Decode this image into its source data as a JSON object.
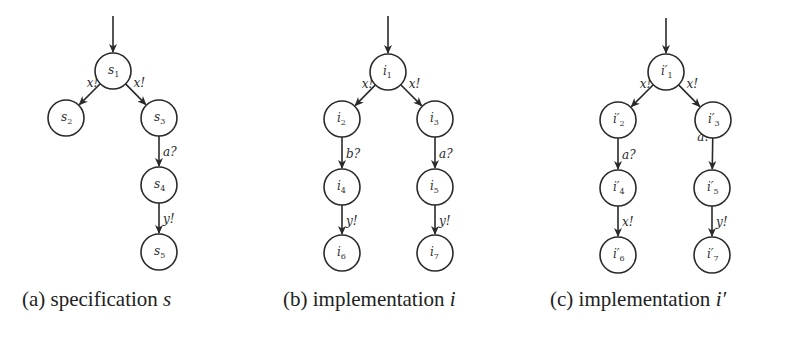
{
  "figure": {
    "panels": [
      {
        "id": "a",
        "caption_prefix": "(a) specification ",
        "caption_var": "s",
        "caption_x": 22,
        "init_arrow": {
          "x": 113,
          "y1": 16,
          "y2": 52
        },
        "nodes": [
          {
            "id": "s1",
            "base": "s",
            "prime": "",
            "sub": "1",
            "x": 113,
            "y": 71
          },
          {
            "id": "s2",
            "base": "s",
            "prime": "",
            "sub": "2",
            "x": 66,
            "y": 118
          },
          {
            "id": "s3",
            "base": "s",
            "prime": "",
            "sub": "3",
            "x": 159,
            "y": 118
          },
          {
            "id": "s4",
            "base": "s",
            "prime": "",
            "sub": "4",
            "x": 159,
            "y": 185
          },
          {
            "id": "s5",
            "base": "s",
            "prime": "",
            "sub": "5",
            "x": 159,
            "y": 252
          }
        ],
        "edges": [
          {
            "from": "s1",
            "to": "s2",
            "label": "x!"
          },
          {
            "from": "s1",
            "to": "s3",
            "label": "x!"
          },
          {
            "from": "s3",
            "to": "s4",
            "label": "a?"
          },
          {
            "from": "s4",
            "to": "s5",
            "label": "y!"
          }
        ]
      },
      {
        "id": "b",
        "caption_prefix": "(b) implementation ",
        "caption_var": "i",
        "caption_x": 283,
        "init_arrow": {
          "x": 388,
          "y1": 16,
          "y2": 53
        },
        "nodes": [
          {
            "id": "i1",
            "base": "i",
            "prime": "",
            "sub": "1",
            "x": 388,
            "y": 72
          },
          {
            "id": "i2",
            "base": "i",
            "prime": "",
            "sub": "2",
            "x": 342,
            "y": 119
          },
          {
            "id": "i3",
            "base": "i",
            "prime": "",
            "sub": "3",
            "x": 435,
            "y": 119
          },
          {
            "id": "i4",
            "base": "i",
            "prime": "",
            "sub": "4",
            "x": 342,
            "y": 187
          },
          {
            "id": "i5",
            "base": "i",
            "prime": "",
            "sub": "5",
            "x": 435,
            "y": 187
          },
          {
            "id": "i6",
            "base": "i",
            "prime": "",
            "sub": "6",
            "x": 342,
            "y": 253
          },
          {
            "id": "i7",
            "base": "i",
            "prime": "",
            "sub": "7",
            "x": 435,
            "y": 253
          }
        ],
        "edges": [
          {
            "from": "i1",
            "to": "i2",
            "label": "x!"
          },
          {
            "from": "i1",
            "to": "i3",
            "label": "x!"
          },
          {
            "from": "i2",
            "to": "i4",
            "label": "b?"
          },
          {
            "from": "i3",
            "to": "i5",
            "label": "a?"
          },
          {
            "from": "i4",
            "to": "i6",
            "label": "y!"
          },
          {
            "from": "i5",
            "to": "i7",
            "label": "y!"
          }
        ]
      },
      {
        "id": "c",
        "caption_prefix": "(c) implementation ",
        "caption_var": "i′",
        "caption_x": 550,
        "init_arrow": {
          "x": 666,
          "y1": 18,
          "y2": 53
        },
        "nodes": [
          {
            "id": "ip1",
            "base": "i",
            "prime": "′",
            "sub": "1",
            "x": 666,
            "y": 72
          },
          {
            "id": "ip2",
            "base": "i",
            "prime": "′",
            "sub": "2",
            "x": 618,
            "y": 120
          },
          {
            "id": "ip3",
            "base": "i",
            "prime": "′",
            "sub": "3",
            "x": 713,
            "y": 120
          },
          {
            "id": "ip4",
            "base": "i",
            "prime": "′",
            "sub": "4",
            "x": 618,
            "y": 188
          },
          {
            "id": "ip5",
            "base": "i",
            "prime": "′",
            "sub": "5",
            "x": 712,
            "y": 188
          },
          {
            "id": "ip6",
            "base": "i",
            "prime": "′",
            "sub": "6",
            "x": 618,
            "y": 255
          },
          {
            "id": "ip7",
            "base": "i",
            "prime": "′",
            "sub": "7",
            "x": 712,
            "y": 255
          }
        ],
        "edges": [
          {
            "from": "ip1",
            "to": "ip2",
            "label": "x!"
          },
          {
            "from": "ip1",
            "to": "ip3",
            "label": "x!"
          },
          {
            "from": "ip2",
            "to": "ip4",
            "label": "a?"
          },
          {
            "from": "ip3",
            "to": "ip5",
            "label": "a?"
          },
          {
            "from": "ip4",
            "to": "ip6",
            "label": "x!"
          },
          {
            "from": "ip5",
            "to": "ip7",
            "label": "y!"
          }
        ]
      }
    ],
    "style": {
      "node_radius": 18,
      "stroke_color": "#2a2a2a",
      "background": "#ffffff"
    }
  }
}
